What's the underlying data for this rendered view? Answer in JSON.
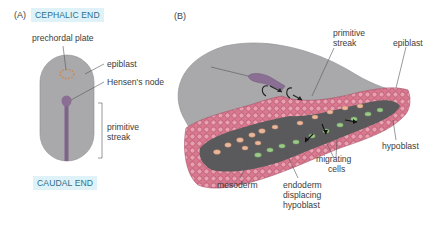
{
  "panel_a": {
    "letter": "(A)",
    "top_label": "CEPHALIC END",
    "bottom_label": "CAUDAL END",
    "labels": {
      "prechordal_plate": "prechordal plate",
      "epiblast": "epiblast",
      "hensens_node": "Hensen's node",
      "primitive_streak_line1": "primitive",
      "primitive_streak_line2": "streak"
    }
  },
  "panel_b": {
    "letter": "(B)",
    "labels": {
      "primitive_streak_line1": "primitive",
      "primitive_streak_line2": "streak",
      "epiblast": "epiblast",
      "hypoblast": "hypoblast",
      "migrating_cells_line1": "migrating",
      "migrating_cells_line2": "cells",
      "mesoderm": "mesoderm",
      "endoderm_line1": "endoderm",
      "endoderm_line2": "displacing",
      "endoderm_line3": "hypoblast"
    }
  },
  "colors": {
    "embryo_gray": "#a9a8ab",
    "streak_purple": "#8a6e94",
    "epiblast_pink": "#d9798f",
    "interior_dark": "#5a5a5c",
    "endoderm_green": "#9bc98a",
    "mesoderm_peach": "#e9b89c",
    "tag_bg": "#dff2f8",
    "tag_text": "#2f6f8a"
  }
}
